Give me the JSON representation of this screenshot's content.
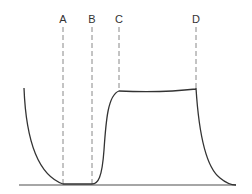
{
  "diagram": {
    "type": "line",
    "markers": [
      {
        "label": "A",
        "x": 63
      },
      {
        "label": "B",
        "x": 92
      },
      {
        "label": "C",
        "x": 119
      },
      {
        "label": "D",
        "x": 196
      }
    ],
    "curve_color": "#333333",
    "dash_color": "#888888",
    "baseline_color": "#888888"
  }
}
